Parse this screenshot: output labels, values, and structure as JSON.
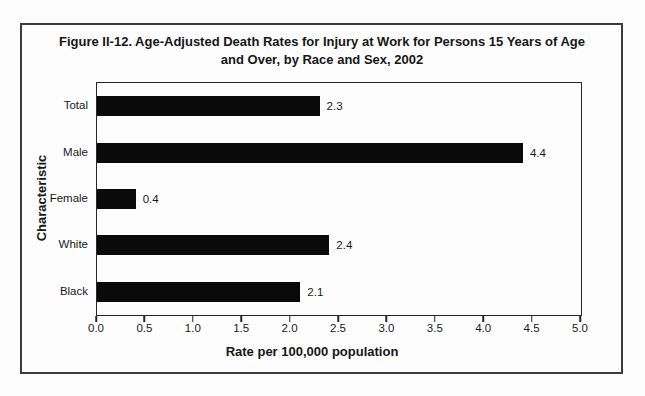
{
  "figure": {
    "title": "Figure II-12. Age-Adjusted Death Rates for Injury at Work for Persons 15 Years of Age and Over, by Race and Sex, 2002"
  },
  "chart_data": {
    "type": "bar",
    "orientation": "horizontal",
    "title": "Figure II-12. Age-Adjusted Death Rates for Injury at Work for Persons 15 Years of Age and Over, by Race and Sex, 2002",
    "categories": [
      "Total",
      "Male",
      "Female",
      "White",
      "Black"
    ],
    "values": [
      2.3,
      4.4,
      0.4,
      2.4,
      2.1
    ],
    "value_labels": [
      "2.3",
      "4.4",
      "0.4",
      "2.4",
      "2.1"
    ],
    "xlabel": "Rate per 100,000 population",
    "ylabel": "Characteristic",
    "xlim": [
      0.0,
      5.0
    ],
    "xtick_labels": [
      "0.0",
      "0.5",
      "1.0",
      "1.5",
      "2.0",
      "2.5",
      "3.0",
      "3.5",
      "4.0",
      "4.5",
      "5.0"
    ],
    "grid": false,
    "legend": null,
    "bar_color": "#0a0a0a"
  }
}
